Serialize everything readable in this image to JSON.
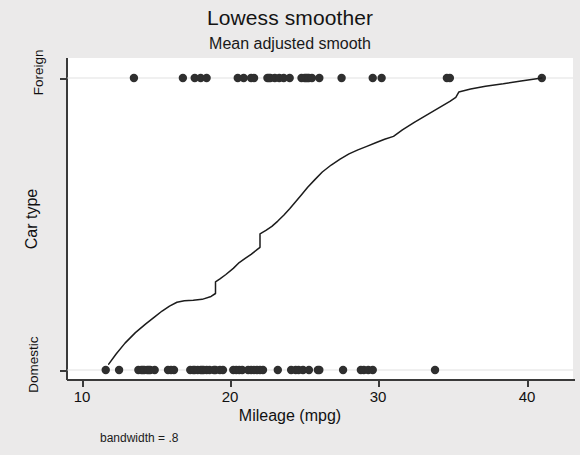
{
  "chart_data": {
    "type": "scatter",
    "title": "Lowess smoother",
    "subtitle": "Mean adjusted smooth",
    "xlabel": "Mileage (mpg)",
    "ylabel": "Car type",
    "note": "bandwidth = .8",
    "xlim": [
      9.0,
      42.0
    ],
    "ylim": [
      -0.06,
      1.06
    ],
    "xticks": [
      10,
      20,
      30,
      40
    ],
    "xtick_labels": [
      "10",
      "20",
      "30",
      "40"
    ],
    "yticks": [
      0,
      1
    ],
    "ytick_labels": [
      "Domestic",
      "Foreign"
    ],
    "grid": "horizontal-at-ytick-levels",
    "legend": "none",
    "series": [
      {
        "name": "Foreign",
        "marker": "filled-circle",
        "y_value": 1,
        "x": [
          13.5,
          16.8,
          17.6,
          18.0,
          18.4,
          20.5,
          20.9,
          21.4,
          21.6,
          22.5,
          22.6,
          22.7,
          23.0,
          23.3,
          23.6,
          24.0,
          24.8,
          25.0,
          25.1,
          25.2,
          25.3,
          25.5,
          26.0,
          27.5,
          29.6,
          30.2,
          34.6,
          34.8,
          41.0
        ]
      },
      {
        "name": "Domestic",
        "marker": "filled-circle",
        "y_value": 0,
        "x": [
          11.6,
          12.5,
          13.8,
          14.0,
          14.1,
          14.2,
          14.4,
          14.5,
          14.6,
          14.9,
          15.8,
          16.0,
          16.2,
          17.3,
          17.5,
          17.6,
          17.8,
          18.0,
          18.1,
          18.2,
          18.4,
          18.6,
          18.9,
          19.0,
          19.3,
          19.5,
          20.2,
          20.4,
          20.6,
          20.8,
          21.2,
          21.4,
          21.6,
          21.8,
          22.0,
          22.2,
          23.2,
          24.1,
          24.4,
          24.6,
          24.9,
          25.3,
          25.9,
          26.0,
          27.6,
          28.8,
          29.0,
          29.3,
          29.6,
          33.8
        ]
      }
    ],
    "smoother": {
      "name": "lowess",
      "bandwidth": 0.8,
      "points": [
        [
          11.8,
          0.02
        ],
        [
          12.3,
          0.055
        ],
        [
          12.9,
          0.092
        ],
        [
          13.6,
          0.128
        ],
        [
          14.3,
          0.158
        ],
        [
          14.9,
          0.182
        ],
        [
          15.4,
          0.202
        ],
        [
          15.9,
          0.219
        ],
        [
          16.4,
          0.232
        ],
        [
          16.9,
          0.237
        ],
        [
          17.5,
          0.239
        ],
        [
          18.1,
          0.242
        ],
        [
          18.7,
          0.252
        ],
        [
          19.0,
          0.262
        ],
        [
          19.0,
          0.302
        ],
        [
          19.3,
          0.312
        ],
        [
          19.7,
          0.327
        ],
        [
          20.2,
          0.348
        ],
        [
          20.6,
          0.368
        ],
        [
          21.0,
          0.382
        ],
        [
          21.4,
          0.396
        ],
        [
          21.8,
          0.412
        ],
        [
          22.0,
          0.42
        ],
        [
          22.0,
          0.466
        ],
        [
          22.4,
          0.478
        ],
        [
          22.8,
          0.492
        ],
        [
          23.2,
          0.51
        ],
        [
          23.6,
          0.53
        ],
        [
          24.0,
          0.552
        ],
        [
          24.4,
          0.576
        ],
        [
          24.8,
          0.6
        ],
        [
          25.2,
          0.625
        ],
        [
          25.7,
          0.652
        ],
        [
          26.2,
          0.678
        ],
        [
          26.8,
          0.702
        ],
        [
          27.4,
          0.722
        ],
        [
          28.0,
          0.74
        ],
        [
          28.6,
          0.754
        ],
        [
          29.2,
          0.766
        ],
        [
          29.8,
          0.778
        ],
        [
          30.4,
          0.79
        ],
        [
          31.0,
          0.8
        ],
        [
          31.6,
          0.822
        ],
        [
          32.4,
          0.848
        ],
        [
          33.2,
          0.872
        ],
        [
          34.0,
          0.896
        ],
        [
          34.8,
          0.92
        ],
        [
          35.2,
          0.934
        ],
        [
          35.4,
          0.952
        ],
        [
          36.2,
          0.962
        ],
        [
          37.2,
          0.972
        ],
        [
          38.4,
          0.98
        ],
        [
          39.6,
          0.99
        ],
        [
          41.0,
          1.0
        ]
      ]
    }
  },
  "figure": {
    "title": "Lowess smoother",
    "subtitle": "Mean adjusted smooth",
    "xaxis_title": "Mileage (mpg)",
    "yaxis_title": "Car type",
    "footnote": "bandwidth = .8",
    "xtick_10": "10",
    "xtick_20": "20",
    "xtick_30": "30",
    "xtick_40": "40",
    "ytick_foreign": "Foreign",
    "ytick_domestic": "Domestic"
  },
  "colors": {
    "page_background": "#ebeaea",
    "plot_background": "#ffffff",
    "marker": "#2f2f2f",
    "line": "#1c1c1c",
    "axis": "#3a3a3a",
    "gridline": "#d9d9d9",
    "text": "#111111"
  }
}
